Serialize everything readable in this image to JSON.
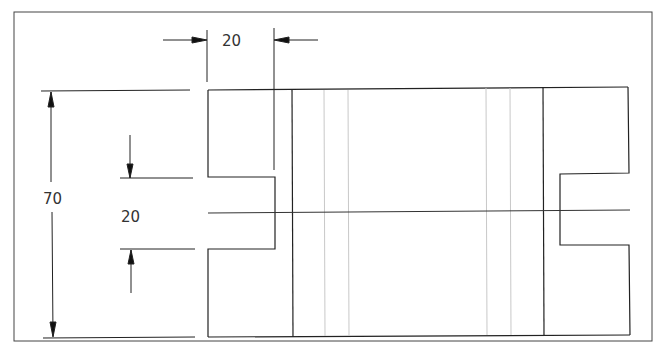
{
  "drawing": {
    "type": "orthographic technical drawing",
    "dimensions": {
      "notch_width": "20",
      "overall_height": "70",
      "notch_height": "20"
    },
    "colors": {
      "line": "#222222",
      "hidden_line": "#c8c8c8",
      "background": "#ffffff"
    }
  }
}
